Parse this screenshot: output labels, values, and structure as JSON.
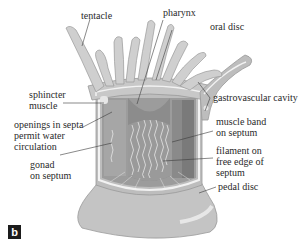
{
  "figure": {
    "panel_label": "b",
    "labels": {
      "tentacle": "tentacle",
      "pharynx": "pharynx",
      "oral_disc": "oral disc",
      "sphincter_muscle_l1": "sphincter",
      "sphincter_muscle_l2": "muscle",
      "gastrovascular_cavity": "gastrovascular cavity",
      "openings_l1": "openings in septa",
      "openings_l2": "permit water",
      "openings_l3": "circulation",
      "muscle_band_l1": "muscle band",
      "muscle_band_l2": "on septum",
      "gonad_l1": "gonad",
      "gonad_l2": "on septum",
      "filament_l1": "filament on",
      "filament_l2": "free edge of",
      "filament_l3": "septum",
      "pedal_disc": "pedal disc"
    },
    "colors": {
      "body_outer": "#c9c9c9",
      "body_inner": "#a9a9a9",
      "cavity": "#8f8f8f",
      "septum_dark": "#7c7c7c",
      "highlight": "#f0f0f0",
      "badge_bg": "#1c1c1c",
      "badge_text": "#ffffff",
      "leader_line": "#3a3a3a"
    }
  }
}
